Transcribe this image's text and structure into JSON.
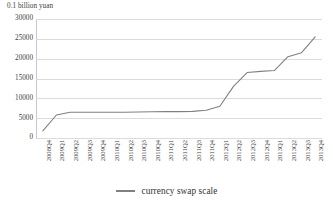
{
  "chart_data": {
    "type": "line",
    "title": "",
    "subtitle": "",
    "unit_caption": "0.1 billion yuan",
    "xlabel": "",
    "ylabel": "",
    "ylim": [
      0,
      30000
    ],
    "ytick_values": [
      0,
      5000,
      10000,
      15000,
      20000,
      25000,
      30000
    ],
    "ytick_labels": [
      "0",
      "5000",
      "10000",
      "15000",
      "20000",
      "25000",
      "30000"
    ],
    "grid": true,
    "grid_axis": "y",
    "legend_position": "bottom-center",
    "categories": [
      "2008Q4",
      "2009Q1",
      "2009Q2",
      "2009Q3",
      "2009Q4",
      "2010Q1",
      "2010Q2",
      "2010Q3",
      "2010Q4",
      "2011Q1",
      "2011Q2",
      "2011Q3",
      "2011Q4",
      "2012Q1",
      "2012Q2",
      "2012Q3",
      "2012Q4",
      "2013Q1",
      "2013Q2",
      "2013Q3",
      "2013Q4"
    ],
    "series": [
      {
        "name": "currency swap scale",
        "color": "#808080",
        "values": [
          1800,
          5800,
          6500,
          6500,
          6500,
          6500,
          6500,
          6550,
          6600,
          6650,
          6650,
          6700,
          7000,
          8000,
          13000,
          16500,
          16800,
          17000,
          20500,
          21500,
          25500
        ]
      }
    ]
  },
  "legend": {
    "entries": [
      {
        "label": "currency swap scale",
        "color": "#808080"
      }
    ]
  }
}
